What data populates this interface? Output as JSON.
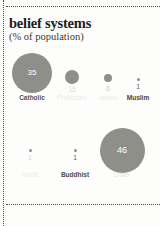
{
  "title": "belief systems",
  "subtitle": "(% of population)",
  "colors": {
    "bubble": "#8f8f8a",
    "bubble_value_text": "#ffffff",
    "outside_value_text": "#6d6d68",
    "label_strong": "#44443f",
    "label_faded": "#c9c9c4",
    "rule": "#4a4a46",
    "background": "#fdfdfb",
    "title_text": "#1d1d1b"
  },
  "chart_data": {
    "type": "bar",
    "title": "belief systems",
    "subtitle": "(% of population)",
    "xlabel": "",
    "ylabel": "% of population",
    "categories": [
      "Catholic",
      "Protestant",
      "Jewish",
      "Muslim",
      "Hindu",
      "Buddhist",
      "Other"
    ],
    "values": [
      35,
      15,
      6,
      1,
      1,
      1,
      46
    ],
    "value_labels": [
      "35",
      "15",
      "6",
      "1",
      "1",
      "1",
      "46"
    ],
    "ylim": [
      0,
      50
    ],
    "grid": false,
    "legend": false
  },
  "rows": [
    {
      "items": [
        {
          "label": "Catholic",
          "value": "35",
          "size": 40.0,
          "inside": true,
          "label_opacity": 0.92,
          "x": 32,
          "y": 73
        },
        {
          "label": "Protestant",
          "value": "15",
          "size": 14.5,
          "inside": false,
          "label_opacity": 0.22,
          "x": 72,
          "y": 77
        },
        {
          "label": "Jewish",
          "value": "6",
          "size": 8.5,
          "inside": false,
          "label_opacity": 0.3,
          "x": 108,
          "y": 78
        },
        {
          "label": "Muslim",
          "value": "1",
          "size": 3.0,
          "inside": false,
          "label_opacity": 1.0,
          "x": 138,
          "y": 79
        }
      ]
    },
    {
      "items": [
        {
          "label": "Hindu",
          "value": "1",
          "size": 3.0,
          "inside": false,
          "label_opacity": 0.22,
          "x": 30,
          "y": 150
        },
        {
          "label": "Buddhist",
          "value": "1",
          "size": 3.0,
          "inside": false,
          "label_opacity": 0.95,
          "x": 75,
          "y": 150
        },
        {
          "label": "Other",
          "value": "46",
          "size": 45.0,
          "inside": true,
          "label_opacity": 0.5,
          "x": 122,
          "y": 150
        }
      ]
    }
  ],
  "row_label_y": [
    95,
    172
  ]
}
